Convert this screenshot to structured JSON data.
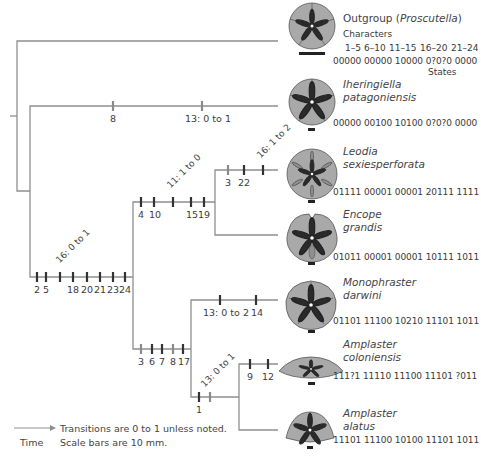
{
  "colors": {
    "branch": "#8f8f8f",
    "tick_dark": "#333333",
    "tick_gray": "#8a8a8a",
    "fossil_fill": "#a9a9a9",
    "fossil_petal": "#2a2a2a",
    "text": "#3c3c3c"
  },
  "header": {
    "outgroup_prefix": "Outgroup (",
    "outgroup_genus": "Proscutella",
    "outgroup_suffix": ")",
    "characters_label": "Characters",
    "ranges": [
      "1–5",
      "6–10",
      "11–15",
      "16–20",
      "21–24"
    ],
    "states_label": "States"
  },
  "taxa": [
    {
      "name_line1": "Outgroup",
      "name_line2": "Proscutella",
      "states": "00000 00000 10000 0?0?0  0000"
    },
    {
      "name_line1": "Iheringiella",
      "name_line2": "patagoniensis",
      "states": "00000 00100 10100 0?0?0  0000"
    },
    {
      "name_line1": "Leodia",
      "name_line2": "sexiesperforata",
      "states": "01111 00001 00001 20111  1111"
    },
    {
      "name_line1": "Encope",
      "name_line2": "grandis",
      "states": "01011 00001 00001 10111  1011"
    },
    {
      "name_line1": "Monophraster",
      "name_line2": "darwini",
      "states": "01101 11100 10210 11101  1011"
    },
    {
      "name_line1": "Amplaster",
      "name_line2": "coloniensis",
      "states": "111?1 11110 11100 11101  ?011"
    },
    {
      "name_line1": "Amplaster",
      "name_line2": "alatus",
      "states": "11101 11100 10100 11101  1011"
    }
  ],
  "branches": {
    "iheringiella": {
      "ticks": [
        {
          "label": "8",
          "tone": "gray"
        },
        {
          "label": "13: 0 to 1",
          "tone": "gray"
        }
      ]
    },
    "main_ingroup": {
      "ticks": [
        {
          "label": "2",
          "tone": "dark"
        },
        {
          "label": "5",
          "tone": "dark"
        },
        {
          "label": "16: 0 to 1",
          "tone": "dark",
          "rotated": true
        },
        {
          "label": "18",
          "tone": "dark"
        },
        {
          "label": "20",
          "tone": "dark"
        },
        {
          "label": "21",
          "tone": "dark"
        },
        {
          "label": "23",
          "tone": "dark"
        },
        {
          "label": "24",
          "tone": "dark"
        }
      ]
    },
    "encopinae": {
      "ticks": [
        {
          "label": "4",
          "tone": "dark"
        },
        {
          "label": "10",
          "tone": "dark"
        },
        {
          "label": "11: 1 to 0",
          "tone": "dark",
          "rotated": true
        },
        {
          "label": "15",
          "tone": "dark"
        },
        {
          "label": "19",
          "tone": "dark"
        }
      ]
    },
    "leodia": {
      "ticks": [
        {
          "label": "3",
          "tone": "gray"
        },
        {
          "label": "22",
          "tone": "dark"
        },
        {
          "label": "16: 1 to 2",
          "tone": "dark",
          "rotated": true
        }
      ]
    },
    "monophorasterinae": {
      "ticks": [
        {
          "label": "3",
          "tone": "gray"
        },
        {
          "label": "6",
          "tone": "dark"
        },
        {
          "label": "7",
          "tone": "dark"
        },
        {
          "label": "8",
          "tone": "gray"
        },
        {
          "label": "17",
          "tone": "dark"
        }
      ]
    },
    "monophraster": {
      "ticks": [
        {
          "label": "13: 0 to 2",
          "tone": "dark"
        },
        {
          "label": "14",
          "tone": "dark"
        }
      ]
    },
    "amplaster": {
      "ticks": [
        {
          "label": "1",
          "tone": "dark"
        },
        {
          "label": "13: 0 to 1",
          "tone": "gray",
          "rotated": true
        }
      ]
    },
    "coloniensis": {
      "ticks": [
        {
          "label": "9",
          "tone": "dark"
        },
        {
          "label": "12",
          "tone": "dark"
        }
      ]
    }
  },
  "legend": {
    "arrow_label": "Time",
    "line1": "Transitions are 0 to 1 unless noted.",
    "line2": "Scale bars are 10 mm."
  }
}
